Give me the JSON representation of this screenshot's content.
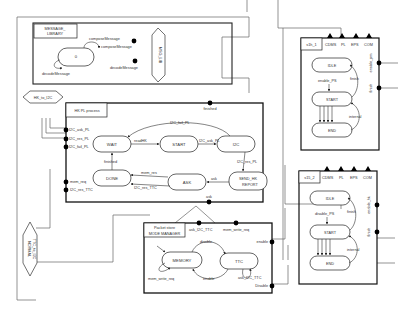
{
  "diagram": {
    "message_library": {
      "title_line1": "MESSAGE_",
      "title_line2": "LIBRARY",
      "state": "0",
      "transitions": [
        "composeMessage",
        "decodeMessage"
      ],
      "ports": [
        "composeMessage",
        "decodeMessage"
      ],
      "interface": "MSG_LIB"
    },
    "hk_to_i2c": {
      "label": "HK_to_I2C"
    },
    "hk_pl_process": {
      "title": "HK PL process",
      "ports_left": [
        "I2C_ask_PL",
        "I2C_res_PL",
        "I2C_fail_PL",
        "mem_req",
        "I2C_res_TTC"
      ],
      "port_top": "finished",
      "port_bottom": "ask",
      "states": [
        "WAIT",
        "START",
        "I2C",
        "DONE",
        "ASK",
        "SEND_HK_REPORT"
      ],
      "send_hk_line1": "SEND_HK",
      "send_hk_line2": "REPORT",
      "transitions": {
        "i2c_fail": "I2C_fail_PL",
        "wait_start": "readHK",
        "start_i2c": "I2C_ask_PL",
        "i2c_send": "I2C_res_PL",
        "send_ask": "ask",
        "ask_done_1": "mem_res",
        "ask_done_2": "I2C_res_TTC",
        "done_wait": "finished"
      }
    },
    "packet_store": {
      "title_line1": "Packet store",
      "title_line2": "MODE MANAGER",
      "ports_top": [
        "ask_I2C_TTC",
        "mem_write_req"
      ],
      "ports_right": [
        "enable",
        "Disable"
      ],
      "states": [
        "MEMORY",
        "TTC"
      ],
      "transitions": {
        "mem_ttc": "disable",
        "ttc_mem": "enable",
        "mem_self": "mem_write_req",
        "ttc_self": "ask_I2C_TTC"
      }
    },
    "lower_interface": {
      "line1": "TTC_to_I2C",
      "line2": "NORMAL"
    },
    "s1": {
      "title": "s1h_1",
      "buses": [
        "CDMS",
        "PL",
        "EPS",
        "COM"
      ],
      "states": [
        "IDLE",
        "START",
        "END"
      ],
      "transitions": {
        "idle_start": "enable_PS",
        "start_idle": "finish",
        "start_end": "internal"
      },
      "ports_right": [
        "enable_pm",
        "finish"
      ]
    },
    "s2": {
      "title": "s15_2",
      "buses": [
        "CDMS",
        "PL",
        "EPS",
        "COM"
      ],
      "states": [
        "IDLE",
        "START",
        "END"
      ],
      "transitions": {
        "idle_start": "disable_PS",
        "start_idle": "finish",
        "start_end": "internal"
      },
      "ports_right": [
        "enable_hk",
        "finish"
      ]
    }
  }
}
